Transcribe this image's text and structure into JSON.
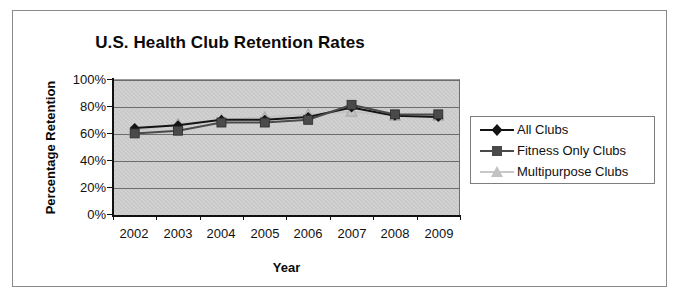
{
  "figure": {
    "background_color": "#ffffff",
    "frame_color": "#8a8a8a",
    "plot_background_color": "#c9c9c9",
    "gridline_color": "#6b6b6b",
    "caption": ""
  },
  "chart_data": {
    "type": "line",
    "title": "U.S. Health Club Retention Rates",
    "xlabel": "Year",
    "ylabel": "Percentage Retention",
    "categories": [
      "2002",
      "2003",
      "2004",
      "2005",
      "2006",
      "2007",
      "2008",
      "2009"
    ],
    "x": [
      2002,
      2003,
      2004,
      2005,
      2006,
      2007,
      2008,
      2009
    ],
    "ylim": [
      0,
      100
    ],
    "yticks": [
      0,
      20,
      40,
      60,
      80,
      100
    ],
    "ytick_labels": [
      "0%",
      "20%",
      "40%",
      "60%",
      "80%",
      "100%"
    ],
    "grid": true,
    "grid_axis": "y",
    "legend_position": "right",
    "series": [
      {
        "name": "All Clubs",
        "marker": "diamond",
        "color": "#141414",
        "values": [
          64,
          66,
          70,
          70,
          72,
          79,
          73,
          72
        ]
      },
      {
        "name": "Fitness Only Clubs",
        "marker": "square",
        "color": "#4a4a4a",
        "values": [
          60,
          62,
          68,
          68,
          70,
          81,
          74,
          74
        ]
      },
      {
        "name": "Multipurpose Clubs",
        "marker": "triangle",
        "color": "#c2c2c2",
        "values": [
          62,
          67,
          70,
          72,
          74,
          76,
          73,
          73
        ]
      }
    ]
  },
  "legend": {
    "items": [
      {
        "label": "All Clubs",
        "marker": "diamond-marker-icon",
        "color": "#141414"
      },
      {
        "label": "Fitness Only Clubs",
        "marker": "square-marker-icon",
        "color": "#4a4a4a"
      },
      {
        "label": "Multipurpose Clubs",
        "marker": "triangle-marker-icon",
        "color": "#c2c2c2"
      }
    ]
  }
}
